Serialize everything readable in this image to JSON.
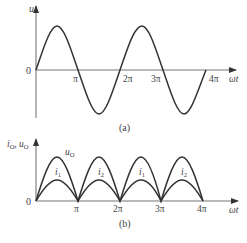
{
  "figure_a": {
    "caption": "(a)",
    "y_label": "u",
    "x_label": "ωt",
    "origin_label": "0",
    "ticks": [
      "π",
      "2π",
      "3π",
      "4π"
    ],
    "curve": "sinusoid, two full periods from 0 to 4π"
  },
  "figure_b": {
    "caption": "(b)",
    "y_label_i": "i",
    "y_label_i_sub": "O",
    "y_label_sep": ", ",
    "y_label_u": "u",
    "y_label_u_sub": "O",
    "x_label": "ωt",
    "origin_label": "0",
    "ticks": [
      "π",
      "2π",
      "3π",
      "4π"
    ],
    "outer_curve_label": "u",
    "outer_curve_label_sub": "O",
    "inner_curve_labels": [
      {
        "main": "i",
        "sub": "1"
      },
      {
        "main": "i",
        "sub": "2"
      },
      {
        "main": "i",
        "sub": "1"
      },
      {
        "main": "i",
        "sub": "2"
      }
    ],
    "curve": "full-wave rectified sinusoid; outer arches u_O, inner arches alternating i_1 / i_2"
  }
}
